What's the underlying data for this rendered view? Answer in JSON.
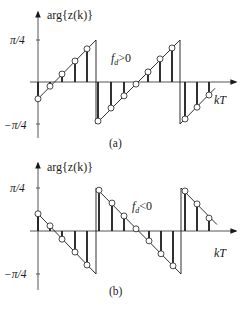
{
  "panels": [
    {
      "id": "a",
      "caption": "(a)",
      "y_axis_label": "arg{z(k)}",
      "x_axis_label": "kT",
      "y_ticks": [
        "π/4",
        "−π/4"
      ],
      "condition_label": {
        "var": "f",
        "sub": "d",
        "rel": ">0"
      },
      "geom": {
        "x0": 38,
        "y_zero": 82,
        "y_top": 40,
        "y_bot": 124,
        "arrow_top": 12,
        "axis_bottom": 138,
        "x_end": 236
      },
      "segments": [
        {
          "x1": 38,
          "v1": -0.4,
          "x2": 96,
          "v2": 1.0
        },
        {
          "x1": 96,
          "v1": -1.0,
          "x2": 180,
          "v2": 1.0
        },
        {
          "x1": 180,
          "v1": -1.0,
          "x2": 215,
          "v2": -0.15
        }
      ],
      "jumps": [
        {
          "x": 96
        },
        {
          "x": 180
        }
      ],
      "samples": [
        {
          "x": 38,
          "v": -0.4
        },
        {
          "x": 50,
          "v": -0.1
        },
        {
          "x": 62,
          "v": 0.19
        },
        {
          "x": 75,
          "v": 0.5
        },
        {
          "x": 87,
          "v": 0.79
        },
        {
          "x": 98,
          "v": -0.93
        },
        {
          "x": 111,
          "v": -0.62
        },
        {
          "x": 124,
          "v": -0.33
        },
        {
          "x": 136,
          "v": -0.05
        },
        {
          "x": 148,
          "v": 0.24
        },
        {
          "x": 160,
          "v": 0.55
        },
        {
          "x": 172,
          "v": 0.81
        },
        {
          "x": 185,
          "v": -0.88
        },
        {
          "x": 197,
          "v": -0.6
        },
        {
          "x": 209,
          "v": -0.31
        }
      ],
      "label_pos": {
        "ylabel": [
          47,
          19
        ],
        "pi4": [
          10,
          44
        ],
        "mpi4": [
          4,
          128
        ],
        "kT": [
          214,
          104
        ],
        "cond": [
          111,
          62
        ],
        "caption": [
          110,
          146
        ]
      }
    },
    {
      "id": "b",
      "caption": "(b)",
      "y_axis_label": "arg{z(k)}",
      "x_axis_label": "kT",
      "y_ticks": [
        "π/4",
        "−π/4"
      ],
      "condition_label": {
        "var": "f",
        "sub": "d",
        "rel": "<0"
      },
      "geom": {
        "x0": 38,
        "y_zero": 231,
        "y_top": 188,
        "y_bot": 274,
        "arrow_top": 163,
        "axis_bottom": 290,
        "x_end": 236
      },
      "segments": [
        {
          "x1": 38,
          "v1": 0.4,
          "x2": 96,
          "v2": -1.0
        },
        {
          "x1": 96,
          "v1": 1.0,
          "x2": 181,
          "v2": -1.0
        },
        {
          "x1": 181,
          "v1": 1.0,
          "x2": 217,
          "v2": 0.15
        }
      ],
      "jumps": [
        {
          "x": 96
        },
        {
          "x": 181
        }
      ],
      "samples": [
        {
          "x": 38,
          "v": 0.4
        },
        {
          "x": 50,
          "v": 0.12
        },
        {
          "x": 62,
          "v": -0.19
        },
        {
          "x": 75,
          "v": -0.49
        },
        {
          "x": 87,
          "v": -0.79
        },
        {
          "x": 99,
          "v": 0.95
        },
        {
          "x": 112,
          "v": 0.65
        },
        {
          "x": 124,
          "v": 0.35
        },
        {
          "x": 136,
          "v": 0.05
        },
        {
          "x": 149,
          "v": -0.23
        },
        {
          "x": 161,
          "v": -0.53
        },
        {
          "x": 173,
          "v": -0.81
        },
        {
          "x": 185,
          "v": 0.93
        },
        {
          "x": 197,
          "v": 0.63
        },
        {
          "x": 209,
          "v": 0.3
        }
      ],
      "label_pos": {
        "ylabel": [
          47,
          170
        ],
        "pi4": [
          10,
          192
        ],
        "mpi4": [
          4,
          277
        ],
        "kT": [
          214,
          257
        ],
        "cond": [
          132,
          210
        ],
        "caption": [
          110,
          294
        ]
      }
    }
  ],
  "colors": {
    "line": "#1a1a1a",
    "axis": "#555555",
    "stem": "#1a1a1a",
    "circle_fill": "#ffffff"
  }
}
